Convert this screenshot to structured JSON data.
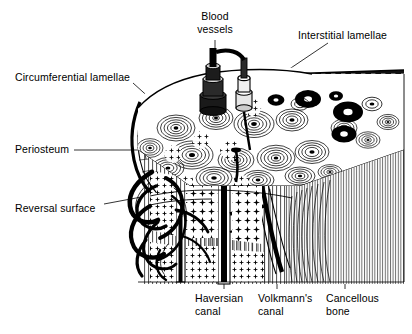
{
  "figure": {
    "width": 412,
    "height": 334,
    "background_color": "#ffffff",
    "ink_color": "#000000",
    "style": "black-and-white line illustration"
  },
  "labels": {
    "blood_vessels": "Blood\nvessels",
    "interstitial_lamellae": "Interstitial lamellae",
    "circumferential_lamellae": "Circumferential lamellae",
    "periosteum": "Periosteum",
    "reversal_surface": "Reversal surface",
    "haversian_canal": "Haversian\ncanal",
    "volkmanns_canal": "Volkmann's\ncanal",
    "cancellous_bone": "Cancellous\nbone"
  }
}
